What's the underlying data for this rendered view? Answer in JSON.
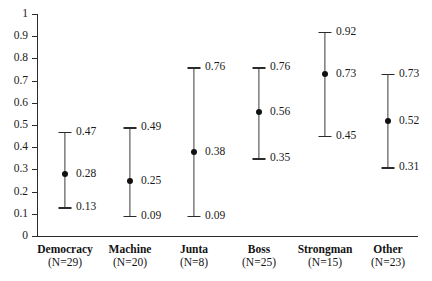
{
  "chart_data": {
    "type": "scatter",
    "title": "",
    "xlabel": "",
    "ylabel": "",
    "ylim": [
      0,
      1
    ],
    "grid": false,
    "legend": null,
    "ytick_labels": [
      "1",
      "0.9",
      "0.8",
      "0.7",
      "0.6",
      "0.5",
      "0.4",
      "0.3",
      "0.2",
      "0.1",
      "0"
    ],
    "ytick_values": [
      1,
      0.9,
      0.8,
      0.7,
      0.6,
      0.5,
      0.4,
      0.3,
      0.2,
      0.1,
      0
    ],
    "categories": [
      "Democracy",
      "Machine",
      "Junta",
      "Boss",
      "Strongman",
      "Other"
    ],
    "counts": [
      "(N=29)",
      "(N=20)",
      "(N=8)",
      "(N=25)",
      "(N=15)",
      "(N=23)"
    ],
    "points": [
      {
        "category": "Democracy",
        "n_label": "(N=29)",
        "estimate": 0.28,
        "lower": 0.13,
        "upper": 0.47,
        "estimate_label": "0.28",
        "lower_label": "0.13",
        "upper_label": "0.47"
      },
      {
        "category": "Machine",
        "n_label": "(N=20)",
        "estimate": 0.25,
        "lower": 0.09,
        "upper": 0.49,
        "estimate_label": "0.25",
        "lower_label": "0.09",
        "upper_label": "0.49"
      },
      {
        "category": "Junta",
        "n_label": "(N=8)",
        "estimate": 0.38,
        "lower": 0.09,
        "upper": 0.76,
        "estimate_label": "0.38",
        "lower_label": "0.09",
        "upper_label": "0.76"
      },
      {
        "category": "Boss",
        "n_label": "(N=25)",
        "estimate": 0.56,
        "lower": 0.35,
        "upper": 0.76,
        "estimate_label": "0.56",
        "lower_label": "0.35",
        "upper_label": "0.76"
      },
      {
        "category": "Strongman",
        "n_label": "(N=15)",
        "estimate": 0.73,
        "lower": 0.45,
        "upper": 0.92,
        "estimate_label": "0.73",
        "lower_label": "0.45",
        "upper_label": "0.92"
      },
      {
        "category": "Other",
        "n_label": "(N=23)",
        "estimate": 0.52,
        "lower": 0.31,
        "upper": 0.73,
        "estimate_label": "0.52",
        "lower_label": "0.31",
        "upper_label": "0.73"
      }
    ],
    "colors": {
      "axis": "#2b2b2b",
      "marker": "#111111",
      "errorbar": "#3a3a3a",
      "text": "#1a1a1a",
      "background": "#ffffff"
    }
  }
}
